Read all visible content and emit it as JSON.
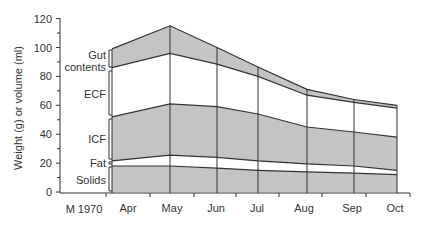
{
  "chart_data": {
    "type": "area",
    "stacked": true,
    "title": "",
    "xlabel": "",
    "ylabel": "Weight (g) or volume (ml)",
    "ylim": [
      0,
      120
    ],
    "yticks": [
      0,
      20,
      40,
      60,
      80,
      100,
      120
    ],
    "start_label": "M 1970",
    "categories": [
      "Apr",
      "May",
      "Jun",
      "Jul",
      "Aug",
      "Sep",
      "Oct"
    ],
    "grid": false,
    "legend_position": "left-brackets",
    "boundaries": {
      "solids_top": [
        18,
        18,
        16.5,
        15,
        14,
        13,
        12
      ],
      "fat_top": [
        21.5,
        25.5,
        24,
        21.5,
        19.5,
        18,
        15
      ],
      "icf_top": [
        52,
        61,
        59,
        54,
        45,
        41.5,
        38
      ],
      "ecf_top": [
        86,
        96,
        88.5,
        80,
        67,
        62,
        58
      ],
      "gut_top": [
        99,
        115,
        100,
        86.5,
        71,
        64,
        60
      ]
    },
    "series": [
      {
        "name": "Solids",
        "values": [
          18,
          18,
          16.5,
          15,
          14,
          13,
          12
        ],
        "shaded": true
      },
      {
        "name": "Fat",
        "values": [
          3.5,
          7.5,
          7.5,
          6.5,
          5.5,
          5,
          3
        ],
        "shaded": false
      },
      {
        "name": "ICF",
        "values": [
          30.5,
          35.5,
          35,
          32.5,
          25.5,
          23.5,
          23
        ],
        "shaded": true
      },
      {
        "name": "ECF",
        "values": [
          34,
          35,
          29.5,
          26,
          22,
          20.5,
          20
        ],
        "shaded": false
      },
      {
        "name": "Gut contents",
        "values": [
          13,
          19,
          11.5,
          6.5,
          4,
          2,
          2
        ],
        "shaded": true
      }
    ]
  },
  "labels": {
    "ylabel": "Weight (g) or volume (ml)",
    "gut1": "Gut",
    "gut2": "contents",
    "ecf": "ECF",
    "icf": "ICF",
    "fat": "Fat",
    "solids": "Solids",
    "start": "M 1970",
    "months": [
      "Apr",
      "May",
      "Jun",
      "Jul",
      "Aug",
      "Sep",
      "Oct"
    ],
    "yticks": [
      "0",
      "20",
      "40",
      "60",
      "80",
      "100",
      "120"
    ]
  },
  "colors": {
    "shade": "#c4c4c4",
    "line": "#333333"
  }
}
